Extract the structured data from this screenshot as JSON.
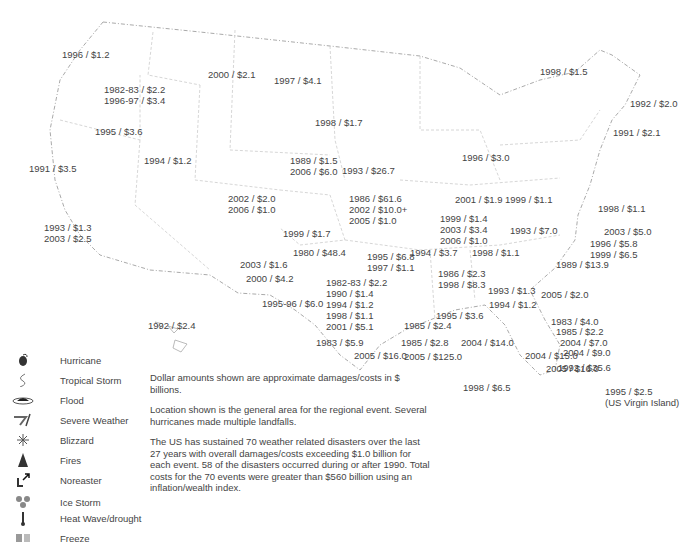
{
  "legend": [
    {
      "icon": "hurricane-icon",
      "label": "Hurricane"
    },
    {
      "icon": "tropical-storm-icon",
      "label": "Tropical Storm"
    },
    {
      "icon": "flood-icon",
      "label": "Flood"
    },
    {
      "icon": "severe-weather-icon",
      "label": "Severe Weather"
    },
    {
      "icon": "blizzard-icon",
      "label": "Blizzard"
    },
    {
      "icon": "fire-icon",
      "label": "Fires"
    },
    {
      "icon": "noreaster-icon",
      "label": "Noreaster"
    },
    {
      "icon": "ice-storm-icon",
      "label": "Ice Storm"
    },
    {
      "icon": "heat-wave-icon",
      "label": "Heat Wave/drought"
    },
    {
      "icon": "freeze-icon",
      "label": "Freeze"
    }
  ],
  "notes": [
    "Dollar amounts shown are approximate damages/costs in $ billions.",
    "Location shown is the general area for the regional event. Several hurricanes made multiple landfalls.",
    "The US has sustained 70 weather related disasters over the last 27 years with overall damages/costs exceeding $1.0 billion for each event. 58 of the disasters occurred during or after 1990. Total costs for the 70 events were greater than $560 billion using an inflation/wealth index."
  ],
  "events": [
    {
      "type": "flood",
      "text": "1996 / $1.2",
      "x": 62,
      "y": 49
    },
    {
      "type": "flood",
      "text": "1982-83 / $2.2\n1996-97 / $3.4",
      "x": 104,
      "y": 84
    },
    {
      "type": "flood",
      "text": "1995 / $3.6",
      "x": 95,
      "y": 126
    },
    {
      "type": "fire",
      "text": "2000 / $2.1",
      "x": 208,
      "y": 69
    },
    {
      "type": "flood",
      "text": "1997 / $4.1",
      "x": 274,
      "y": 75
    },
    {
      "type": "fire",
      "text": "1994 / $1.2",
      "x": 144,
      "y": 155
    },
    {
      "type": "fire",
      "text": "1991 / $3.5",
      "x": 29,
      "y": 163
    },
    {
      "type": "fire",
      "text": "1993 / $1.3\n2003 / $2.5",
      "x": 44,
      "y": 222
    },
    {
      "type": "severe",
      "text": "1998 / $1.7",
      "x": 315,
      "y": 117
    },
    {
      "type": "heat",
      "text": "1989 / $1.5\n2006 / $6.0",
      "x": 290,
      "y": 155
    },
    {
      "type": "flood",
      "text": "1993 / $26.7",
      "x": 342,
      "y": 165
    },
    {
      "type": "fire",
      "text": "2002 / $2.0\n2006 / $1.0",
      "x": 228,
      "y": 193
    },
    {
      "type": "heat",
      "text": "1986 / $61.6\n2002 / $10.0+\n2005 / $1.0",
      "x": 349,
      "y": 193
    },
    {
      "type": "severe",
      "text": "1999 / $1.7",
      "x": 283,
      "y": 228
    },
    {
      "type": "heat",
      "text": "1980 / $48.4",
      "x": 293,
      "y": 247
    },
    {
      "type": "severe",
      "text": "2003 / $1.6",
      "x": 240,
      "y": 259
    },
    {
      "type": "heat",
      "text": "2000 / $4.2",
      "x": 246,
      "y": 273
    },
    {
      "type": "flood",
      "text": "1982-83 / $2.2\n1990 / $1.4\n1994 / $1.2\n1998 / $1.1\n2001 / $5.1",
      "x": 326,
      "y": 277
    },
    {
      "type": "heat",
      "text": "1995-96 / $6.0",
      "x": 262,
      "y": 298
    },
    {
      "type": "flood",
      "text": "1995 / $6.8\n1997 / $1.1",
      "x": 367,
      "y": 251
    },
    {
      "type": "hurricane",
      "text": "1983 / $5.9",
      "x": 316,
      "y": 337
    },
    {
      "type": "hurricane",
      "text": "2005 / $16.0",
      "x": 354,
      "y": 350
    },
    {
      "type": "hurricane",
      "text": "1992 / $2.4",
      "x": 148,
      "y": 320
    },
    {
      "type": "blizzard",
      "text": "1996 / $3.0",
      "x": 462,
      "y": 152
    },
    {
      "type": "severe",
      "text": "2001 / $1.9",
      "x": 455,
      "y": 194
    },
    {
      "type": "heat",
      "text": "1999 / $1.1",
      "x": 505,
      "y": 194
    },
    {
      "type": "severe",
      "text": "1999 / $1.4\n2003 / $3.4\n2006 / $1.0",
      "x": 440,
      "y": 213
    },
    {
      "type": "blizzard",
      "text": "1993 / $7.0",
      "x": 510,
      "y": 225
    },
    {
      "type": "ice",
      "text": "1994 / $3.7",
      "x": 410,
      "y": 247
    },
    {
      "type": "severe",
      "text": "1998 / $1.1",
      "x": 472,
      "y": 247
    },
    {
      "type": "heat",
      "text": "1986 / $2.3\n1998 / $8.3",
      "x": 438,
      "y": 268
    },
    {
      "type": "freeze",
      "text": "1993 / $1.3",
      "x": 488,
      "y": 285
    },
    {
      "type": "hurricane",
      "text": "1994 / $1.2",
      "x": 489,
      "y": 299
    },
    {
      "type": "hurricane",
      "text": "1995 / $3.6",
      "x": 436,
      "y": 310
    },
    {
      "type": "hurricane",
      "text": "1985 / $2.4",
      "x": 404,
      "y": 320
    },
    {
      "type": "hurricane",
      "text": "1985 / $2.8",
      "x": 401,
      "y": 337
    },
    {
      "type": "hurricane",
      "text": "2004 / $14.0",
      "x": 461,
      "y": 337
    },
    {
      "type": "hurricane",
      "text": "2005 / $125.0",
      "x": 404,
      "y": 351
    },
    {
      "type": "hurricane",
      "text": "2004 / $15.0",
      "x": 525,
      "y": 350
    },
    {
      "type": "hurricane",
      "text": "2005 / $16.0",
      "x": 546,
      "y": 363
    },
    {
      "type": "hurricane",
      "text": "1998 / $6.5",
      "x": 463,
      "y": 382
    },
    {
      "type": "hurricane",
      "text": "1998 / $1.1",
      "x": 598,
      "y": 203
    },
    {
      "type": "hurricane",
      "text": "2003 / $5.0",
      "x": 604,
      "y": 226
    },
    {
      "type": "hurricane",
      "text": "1996 / $5.8\n1999 / $6.5",
      "x": 590,
      "y": 238
    },
    {
      "type": "hurricane",
      "text": "1989 / $13.9",
      "x": 556,
      "y": 259
    },
    {
      "type": "hurricane",
      "text": "2005 / $2.0",
      "x": 541,
      "y": 289
    },
    {
      "type": "freeze",
      "text": "1983 / $4.0",
      "x": 551,
      "y": 316
    },
    {
      "type": "hurricane",
      "text": "1985 / $2.2",
      "x": 556,
      "y": 326
    },
    {
      "type": "hurricane",
      "text": "2004 / $7.0",
      "x": 560,
      "y": 337
    },
    {
      "type": "hurricane",
      "text": "2004 / $9.0",
      "x": 563,
      "y": 347
    },
    {
      "type": "hurricane",
      "text": "1992 / $35.6",
      "x": 558,
      "y": 362
    },
    {
      "type": "hurricane",
      "text": "1995 / $2.5\n(US Virgin Island)",
      "x": 605,
      "y": 386
    },
    {
      "type": "ice",
      "text": "1998 / $1.5",
      "x": 540,
      "y": 66
    },
    {
      "type": "noreaster",
      "text": "1992 / $2.0",
      "x": 630,
      "y": 98
    },
    {
      "type": "hurricane",
      "text": "1991 / $2.1",
      "x": 613,
      "y": 127
    }
  ],
  "colors": {
    "text": "#444444",
    "boundary": "#9a9a9a",
    "icon": "#333333"
  }
}
